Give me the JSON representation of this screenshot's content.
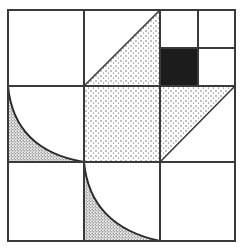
{
  "colors": {
    "line": "#3a3a3a",
    "background": "#ffffff",
    "solid": "#1c1c1c",
    "stipple_light": "#555555",
    "stipple_dense": "#444444"
  },
  "grid": {
    "rows": 3,
    "cols": 3,
    "frame": {
      "left": 8,
      "top": 10,
      "right": 235,
      "bottom": 241
    },
    "vertical_lines": [
      84,
      160
    ],
    "horizontal_lines": [
      86,
      162
    ],
    "subgrid_top_right": {
      "x": 198,
      "y": 48
    }
  },
  "shapes": [
    {
      "name": "stippled-triangle-top-middle",
      "type": "triangle",
      "fill": "light-stipple",
      "points": "84,86 160,10 160,86"
    },
    {
      "name": "stippled-square-center",
      "type": "rect",
      "fill": "light-stipple",
      "points": "84,86 160,162"
    },
    {
      "name": "stippled-triangle-middle-right",
      "type": "triangle",
      "fill": "light-stipple",
      "points": "160,86 235,86 160,162"
    },
    {
      "name": "black-square",
      "type": "rect",
      "fill": "solid",
      "points": "160,48 198,86"
    },
    {
      "name": "dense-quarter-curve-middle-left",
      "type": "curve",
      "fill": "dense-stipple"
    },
    {
      "name": "dense-quarter-curve-bottom-middle",
      "type": "curve",
      "fill": "dense-stipple"
    }
  ]
}
